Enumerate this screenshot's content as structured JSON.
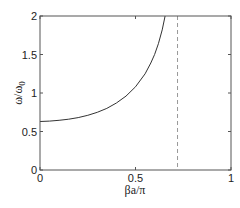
{
  "chart_data": {
    "type": "line",
    "title": "",
    "xlabel": "βa/π",
    "ylabel": "ω/ω0",
    "ylabel_main": "ω/ω",
    "ylabel_sub": "0",
    "xlim": [
      0,
      1
    ],
    "ylim": [
      0,
      2
    ],
    "xticks": [
      0,
      0.5,
      1
    ],
    "xtick_labels": [
      "0",
      "0.5",
      "1"
    ],
    "yticks": [
      0,
      0.5,
      1,
      1.5,
      2
    ],
    "ytick_labels": [
      "0",
      "0.5",
      "1",
      "1.5",
      "2"
    ],
    "grid": false,
    "legend": null,
    "series": [
      {
        "name": "dispersion",
        "style": "solid",
        "color": "#333333",
        "x": [
          0,
          0.05,
          0.1,
          0.15,
          0.2,
          0.25,
          0.3,
          0.35,
          0.4,
          0.45,
          0.5,
          0.55,
          0.58,
          0.6,
          0.62,
          0.64,
          0.655
        ],
        "y": [
          0.63,
          0.635,
          0.645,
          0.66,
          0.68,
          0.71,
          0.75,
          0.8,
          0.87,
          0.96,
          1.08,
          1.25,
          1.39,
          1.5,
          1.64,
          1.82,
          2.0
        ]
      }
    ],
    "annotations": [
      {
        "type": "vline",
        "x": 0.72,
        "style": "dashed",
        "color": "#999999"
      }
    ]
  }
}
